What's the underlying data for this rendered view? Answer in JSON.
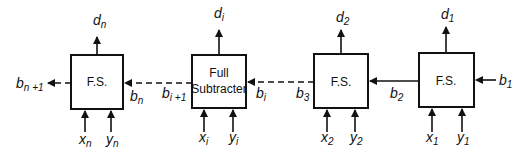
{
  "diagram": {
    "blocks": [
      {
        "id": "fs_n",
        "label": "F.S.",
        "inputs": {
          "x": "x",
          "x_sub": "n",
          "y": "y",
          "y_sub": "n",
          "b_in": "b",
          "b_in_sub": "n"
        },
        "outputs": {
          "d": "d",
          "d_sub": "n",
          "b_out": "b",
          "b_out_sub": "n +1"
        }
      },
      {
        "id": "fs_i",
        "label_line1": "Full",
        "label_line2": "Subtracter",
        "inputs": {
          "x": "x",
          "x_sub": "i",
          "y": "y",
          "y_sub": "i",
          "b_in": "b",
          "b_in_sub": "i"
        },
        "outputs": {
          "d": "d",
          "d_sub": "i",
          "b_out": "b",
          "b_out_sub": "i +1"
        }
      },
      {
        "id": "fs_2",
        "label": "F.S.",
        "inputs": {
          "x": "x",
          "x_sub": "2",
          "y": "y",
          "y_sub": "2",
          "b_in": "b",
          "b_in_sub": "2"
        },
        "outputs": {
          "d": "d",
          "d_sub": "2",
          "b_out": "b",
          "b_out_sub": "3"
        }
      },
      {
        "id": "fs_1",
        "label": "F.S.",
        "inputs": {
          "x": "x",
          "x_sub": "1",
          "y": "y",
          "y_sub": "1",
          "b_in": "b",
          "b_in_sub": "1"
        },
        "outputs": {
          "d": "d",
          "d_sub": "1"
        }
      }
    ],
    "connections": [
      {
        "from": "fs_1",
        "to": "fs_2",
        "signal": "b2",
        "style": "solid"
      },
      {
        "from": "fs_2",
        "to": "fs_i",
        "signal": "b3 … bi",
        "style": "dashed"
      },
      {
        "from": "fs_i",
        "to": "fs_n",
        "signal": "bi+1 … bn",
        "style": "dashed"
      },
      {
        "from": "fs_n",
        "to": "output",
        "signal": "bn+1",
        "style": "dashed"
      }
    ]
  }
}
